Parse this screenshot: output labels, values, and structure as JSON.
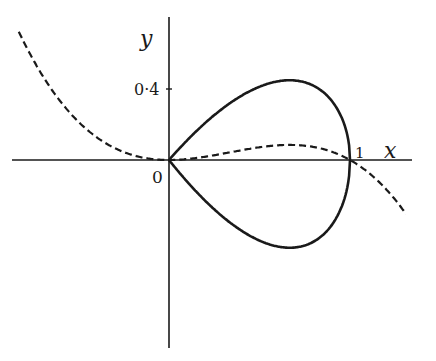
{
  "figure": {
    "axis_labels": {
      "x": "x",
      "y": "y"
    },
    "origin_label": "0",
    "tick_labels": {
      "x_one": "1",
      "y_point4": "0·4"
    },
    "curves": [
      {
        "name": "loop",
        "style": "solid",
        "equation": "y^2 = x^2(1-x)"
      },
      {
        "name": "cubic",
        "style": "dashed",
        "equation": "y = x^2(1-x)"
      }
    ],
    "colors": {
      "ink": "#1a1a1a",
      "background": "#ffffff"
    }
  },
  "chart_data": {
    "type": "line",
    "title": "",
    "xlabel": "x",
    "ylabel": "y",
    "x_ticks": [
      1
    ],
    "y_ticks": [
      0.4
    ],
    "xlim": [
      -0.88,
      1.33
    ],
    "ylim": [
      -0.35,
      0.62
    ],
    "series": [
      {
        "name": "solid loop upper",
        "style": "solid",
        "x": [
          0,
          0.25,
          0.5,
          0.667,
          0.8,
          0.9,
          1.0
        ],
        "y": [
          0,
          0.217,
          0.354,
          0.385,
          0.358,
          0.285,
          0
        ]
      },
      {
        "name": "solid loop lower",
        "style": "solid",
        "x": [
          0,
          0.25,
          0.5,
          0.667,
          0.8,
          0.9,
          1.0
        ],
        "y": [
          0,
          -0.217,
          -0.354,
          -0.385,
          -0.358,
          -0.285,
          0
        ]
      },
      {
        "name": "dashed cubic",
        "style": "dashed",
        "x": [
          -0.85,
          -0.6,
          -0.4,
          -0.2,
          0,
          0.333,
          0.667,
          1.0,
          1.2,
          1.3
        ],
        "y": [
          -1.34,
          -0.58,
          -0.22,
          -0.048,
          0,
          0.074,
          0.148,
          0,
          -0.29,
          -0.51
        ]
      }
    ]
  }
}
